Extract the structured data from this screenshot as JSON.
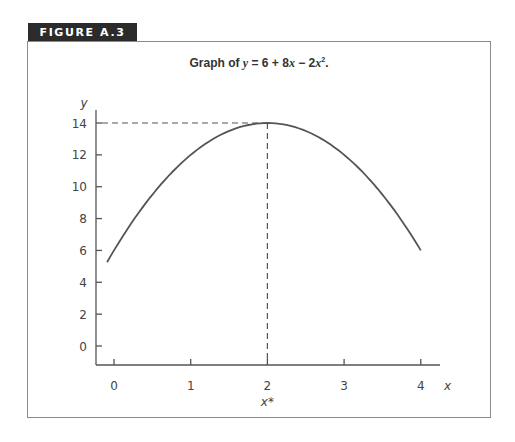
{
  "figure": {
    "label": "FIGURE A.3",
    "title_prefix": "Graph of ",
    "title_eq_y": "y",
    "title_eq_rest": " = 6 + 8",
    "title_eq_x": "x",
    "title_eq_mid": " − 2",
    "title_eq_x2": "x",
    "title_sup": "2",
    "title_suffix": "."
  },
  "chart_data": {
    "type": "line",
    "xlabel": "x",
    "ylabel": "y",
    "x_ticks": [
      0,
      1,
      2,
      3,
      4
    ],
    "y_ticks": [
      0,
      2,
      4,
      6,
      8,
      10,
      12,
      14
    ],
    "xlim": [
      -0.25,
      4.25
    ],
    "ylim": [
      -1.2,
      15
    ],
    "annotation": {
      "label": "x*",
      "x": 2,
      "y": 14,
      "style": "dashed guides to axes"
    },
    "series": [
      {
        "name": "y = 6 + 8x - 2x^2",
        "x": [
          0,
          0.5,
          1,
          1.5,
          2,
          2.5,
          3,
          3.5,
          4
        ],
        "y": [
          6,
          9.5,
          12,
          13.5,
          14,
          13.5,
          12,
          9.5,
          6
        ]
      }
    ],
    "grid": false,
    "legend": "none"
  },
  "labels": {
    "x_axis": "x",
    "y_axis": "y",
    "x_star": "x*",
    "x_ticks": [
      "0",
      "1",
      "2",
      "3",
      "4"
    ],
    "y_ticks": [
      "0",
      "2",
      "4",
      "6",
      "8",
      "10",
      "12",
      "14"
    ]
  }
}
